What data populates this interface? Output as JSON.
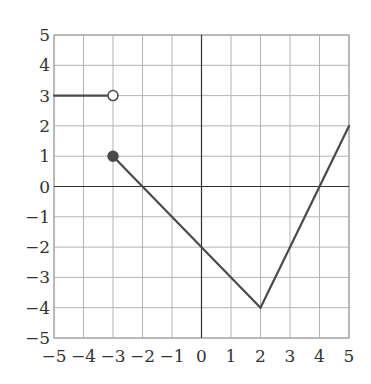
{
  "chart_data": {
    "type": "line",
    "title": "",
    "xlabel": "",
    "ylabel": "",
    "xlim": [
      -5,
      5
    ],
    "ylim": [
      -5,
      5
    ],
    "grid": true,
    "x_ticks": [
      -5,
      -4,
      -3,
      -2,
      -1,
      0,
      1,
      2,
      3,
      4,
      5
    ],
    "y_ticks": [
      -5,
      -4,
      -3,
      -2,
      -1,
      0,
      1,
      2,
      3,
      4,
      5
    ],
    "x_tick_labels": [
      "−5",
      "−4",
      "−3",
      "−2",
      "−1",
      "0",
      "1",
      "2",
      "3",
      "4",
      "5"
    ],
    "y_tick_labels": [
      "−5",
      "−4",
      "−3",
      "−2",
      "−1",
      "0",
      "1",
      "2",
      "3",
      "4",
      "5"
    ],
    "series": [
      {
        "name": "piece-1",
        "description": "horizontal segment y=3 for x<-3",
        "x": [
          -5,
          -3
        ],
        "y": [
          3,
          3
        ],
        "end_marker": {
          "x": -3,
          "y": 3,
          "type": "open"
        }
      },
      {
        "name": "piece-2",
        "description": "line from (-3,1) to (2,-4)",
        "x": [
          -3,
          2
        ],
        "y": [
          1,
          -4
        ],
        "start_marker": {
          "x": -3,
          "y": 1,
          "type": "closed"
        }
      },
      {
        "name": "piece-3",
        "description": "line from (2,-4) to (5,2)",
        "x": [
          2,
          5
        ],
        "y": [
          -4,
          2
        ]
      }
    ],
    "colors": {
      "line": "#4a4a4a",
      "grid": "#b4b4b4",
      "axis": "#333333",
      "open_marker_fill": "#ffffff",
      "closed_marker_fill": "#4a4a4a"
    }
  }
}
